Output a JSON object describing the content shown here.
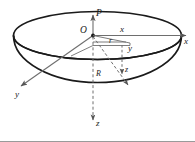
{
  "figure": {
    "type": "3d-coordinate-diagram",
    "background_color": "#ffffff",
    "stroke_color": "#1a1a1a",
    "thin_stroke_color": "#6e6e6e",
    "border_color": "#9a9a9a",
    "labels": {
      "origin": "O",
      "point_p": "P",
      "axis_x_outer": "x",
      "axis_x_inner": "x",
      "axis_y_outer": "y",
      "axis_y_inner": "y",
      "axis_z_outer": "z",
      "axis_z_inner": "z",
      "radius_r": "r",
      "radius_big_r": "R"
    },
    "elements": [
      "top-rim-ellipse",
      "bowl-outline",
      "x-axis-arrow",
      "y-axis-arrow",
      "z-axis-dashed-arrow",
      "p-vertical-arrow",
      "r-segment",
      "R-dashed-arrow",
      "z-drop-dashed-segment",
      "projection-parallelogram"
    ]
  }
}
